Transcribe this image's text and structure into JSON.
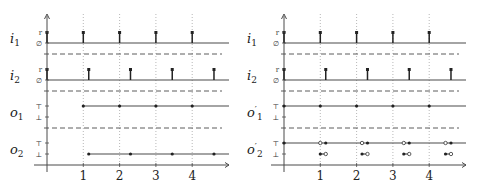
{
  "tick_labels": [
    "1",
    "2",
    "3",
    "4"
  ],
  "left_panel": {
    "signals": [
      {
        "name": "i",
        "sub": "1",
        "prime": "",
        "hi": "r",
        "lo": "∅"
      },
      {
        "name": "i",
        "sub": "2",
        "prime": "",
        "hi": "r",
        "lo": "∅"
      },
      {
        "name": "o",
        "sub": "1",
        "prime": "",
        "hi": "⊤",
        "lo": "⊥"
      },
      {
        "name": "o",
        "sub": "2",
        "prime": "",
        "hi": "⊤",
        "lo": "⊥"
      }
    ],
    "i1_pulses": [
      0,
      1,
      2,
      3,
      4
    ],
    "i2_pulses": [
      0,
      1.15,
      2.3,
      3.45,
      4.6
    ],
    "o1_points_top": [
      1,
      2,
      3,
      4
    ],
    "o2_points_bottom": [
      1.15,
      2.3,
      3.45,
      4.6
    ]
  },
  "right_panel": {
    "signals": [
      {
        "name": "i",
        "sub": "1",
        "prime": "",
        "hi": "r",
        "lo": "∅"
      },
      {
        "name": "i",
        "sub": "2",
        "prime": "",
        "hi": "r",
        "lo": "∅"
      },
      {
        "name": "o",
        "sub": "1",
        "prime": "′",
        "hi": "⊤",
        "lo": "⊥"
      },
      {
        "name": "o",
        "sub": "2",
        "prime": "′",
        "hi": "⊤",
        "lo": "⊥"
      }
    ],
    "i1_pulses": [
      0,
      1,
      2,
      3,
      4
    ],
    "i2_pulses": [
      0,
      1.15,
      2.3,
      3.45,
      4.6
    ],
    "o1_points_top": [
      0,
      1,
      2,
      3,
      4
    ],
    "o2_top_open": [
      1,
      2.15,
      3.3,
      4.45
    ],
    "o2_top_filled": [
      0,
      1.15,
      2.3,
      3.45,
      4.6
    ],
    "o2_bottom_segments": [
      [
        1,
        1.15
      ],
      [
        2.15,
        2.3
      ],
      [
        3.3,
        3.45
      ],
      [
        4.45,
        4.6
      ]
    ]
  },
  "colors": {
    "line": "#4a4a4a",
    "grid": "#9a9a9a",
    "text": "#222222"
  }
}
